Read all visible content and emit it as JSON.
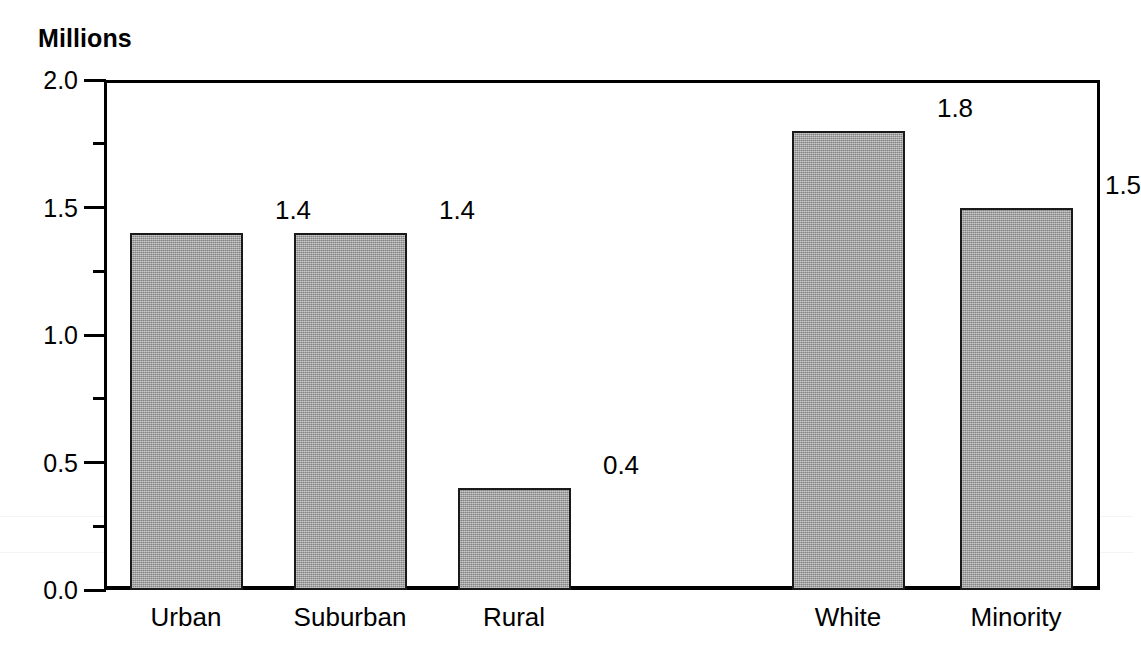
{
  "chart_data": {
    "type": "bar",
    "title": "",
    "subtitle": "",
    "unit_caption": "Millions",
    "xlabel": "",
    "ylabel": "Millions",
    "ylim": [
      0.0,
      2.0
    ],
    "grid": false,
    "legend": false,
    "legend_position": "none",
    "categories": [
      "Urban",
      "Suburban",
      "Rural",
      "White",
      "Minority"
    ],
    "values": [
      1.4,
      1.4,
      0.4,
      1.8,
      1.5
    ],
    "value_labels": [
      "1.4",
      "1.4",
      "0.4",
      "1.8",
      "1.5"
    ],
    "y_major_ticks": [
      0.0,
      0.5,
      1.0,
      1.5,
      2.0
    ],
    "y_major_tick_labels": [
      "0.0",
      "0.5",
      "1.0",
      "1.5",
      "2.0"
    ],
    "y_minor_ticks": [
      0.25,
      0.75,
      1.25,
      1.75
    ],
    "group_gap_after_index": 2,
    "bar_fill_color": "#9e9e9e",
    "bar_border_color": "#1a1a1a",
    "axis_color": "#000000",
    "background_color": "#ffffff"
  },
  "axis": {
    "caption": "Millions",
    "y_labels": [
      {
        "text": "2.0",
        "value": 2.0
      },
      {
        "text": "1.5",
        "value": 1.5
      },
      {
        "text": "1.0",
        "value": 1.0
      },
      {
        "text": "0.5",
        "value": 0.5
      },
      {
        "text": "0.0",
        "value": 0.0
      }
    ]
  },
  "bars": [
    {
      "label": "Urban",
      "value": 1.4,
      "value_label": "1.4"
    },
    {
      "label": "Suburban",
      "value": 1.4,
      "value_label": "1.4"
    },
    {
      "label": "Rural",
      "value": 0.4,
      "value_label": "0.4"
    },
    {
      "label": "White",
      "value": 1.8,
      "value_label": "1.8"
    },
    {
      "label": "Minority",
      "value": 1.5,
      "value_label": "1.5"
    }
  ]
}
